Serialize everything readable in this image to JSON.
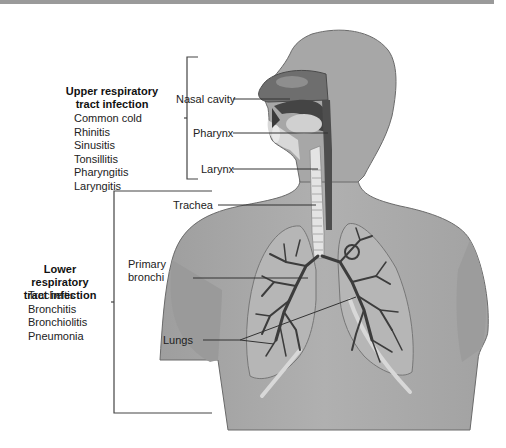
{
  "diagram": {
    "upper_group": {
      "title_line1": "Upper respiratory",
      "title_line2": "tract infection",
      "items": [
        "Common cold",
        "Rhinitis",
        "Sinusitis",
        "Tonsillitis",
        "Pharyngitis",
        "Laryngitis"
      ]
    },
    "lower_group": {
      "title_line1": "Lower respiratory",
      "title_line2": "tract infection",
      "items": [
        "Tracheitis",
        "Bronchitis",
        "Bronchiolitis",
        "Pneumonia"
      ]
    },
    "labels": {
      "nasal_cavity": "Nasal cavity",
      "pharynx": "Pharynx",
      "larynx": "Larynx",
      "trachea": "Trachea",
      "primary_bronchi_line1": "Primary",
      "primary_bronchi_line2": "bronchi",
      "lungs": "Lungs"
    },
    "colors": {
      "body": "#a9a9a9",
      "body_outline": "#6a6a6a",
      "airway_dark": "#5a5a5a",
      "lung_fill": "#b8b8b8",
      "bronchi": "#3c3c3c",
      "leader_line": "#333333"
    }
  }
}
